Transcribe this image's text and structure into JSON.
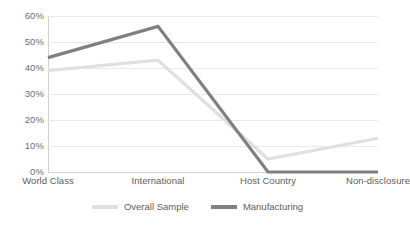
{
  "chart_data": {
    "type": "line",
    "title": "",
    "subtitle": "",
    "xlabel": "",
    "ylabel": "",
    "categories": [
      "World Class",
      "International",
      "Host Country",
      "Non-disclosure"
    ],
    "series": [
      {
        "name": "Overall Sample",
        "color": "#e0e0e0",
        "values": [
          39,
          43,
          5,
          13
        ]
      },
      {
        "name": "Manufacturing",
        "color": "#808080",
        "values": [
          44,
          56,
          0,
          0
        ]
      }
    ],
    "ylim": [
      0,
      60
    ],
    "y_tick_values": [
      0,
      10,
      20,
      30,
      40,
      50,
      60
    ],
    "y_tick_labels": [
      "0%",
      "10%",
      "20%",
      "30%",
      "40%",
      "50%",
      "60%"
    ],
    "grid": true,
    "grid_axis": "y",
    "legend_position": "bottom",
    "background_color": "#ffffff",
    "gridline_color": "#e8e8e8",
    "axis_color": "#d2d2d2",
    "tick_label_color": "#6e6e6e"
  }
}
